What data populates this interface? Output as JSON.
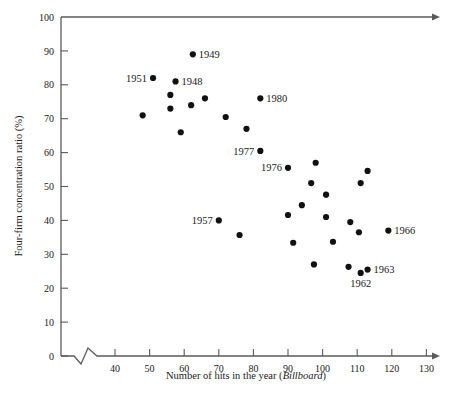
{
  "chart_data": {
    "type": "scatter",
    "title": "",
    "xlabel": "Number of hits in the year (Billboard)",
    "xlabel_plain": "Number of hits in the year (",
    "xlabel_italic": "Billboard",
    "xlabel_tail": ")",
    "ylabel": "Four-firm concentration ratio (%)",
    "xlim": [
      33,
      133
    ],
    "ylim": [
      0,
      100
    ],
    "xticks": [
      40,
      50,
      60,
      70,
      80,
      90,
      100,
      110,
      120,
      130
    ],
    "yticks": [
      0,
      10,
      20,
      30,
      40,
      50,
      60,
      70,
      80,
      90,
      100
    ],
    "xtick_labels": [
      "40",
      "50",
      "60",
      "70",
      "80",
      "90",
      "100",
      "110",
      "120",
      "130"
    ],
    "ytick_labels": [
      "0",
      "10",
      "20",
      "30",
      "40",
      "50",
      "60",
      "70",
      "80",
      "90",
      "100"
    ],
    "grid": false,
    "legend": "none",
    "axis_break_x": true,
    "axis_arrow_x": true,
    "axis_arrow_top": true,
    "marker": "filled-circle",
    "marker_color": "#111111",
    "points": [
      {
        "x": 48,
        "y": 71,
        "label": ""
      },
      {
        "x": 51,
        "y": 82,
        "label": "1951",
        "label_pos": "left"
      },
      {
        "x": 56,
        "y": 77,
        "label": ""
      },
      {
        "x": 56,
        "y": 73,
        "label": ""
      },
      {
        "x": 57.5,
        "y": 81,
        "label": "1948",
        "label_pos": "right"
      },
      {
        "x": 59,
        "y": 66,
        "label": ""
      },
      {
        "x": 62,
        "y": 74,
        "label": ""
      },
      {
        "x": 62.5,
        "y": 89,
        "label": "1949",
        "label_pos": "right"
      },
      {
        "x": 66,
        "y": 76,
        "label": ""
      },
      {
        "x": 70,
        "y": 40,
        "label": "1957",
        "label_pos": "left"
      },
      {
        "x": 72,
        "y": 70.5,
        "label": ""
      },
      {
        "x": 76,
        "y": 35.7,
        "label": ""
      },
      {
        "x": 78,
        "y": 67,
        "label": ""
      },
      {
        "x": 82,
        "y": 60.5,
        "label": "1977",
        "label_pos": "left"
      },
      {
        "x": 82,
        "y": 76,
        "label": "1980",
        "label_pos": "right"
      },
      {
        "x": 90,
        "y": 55.5,
        "label": "1976",
        "label_pos": "left"
      },
      {
        "x": 90,
        "y": 41.6,
        "label": ""
      },
      {
        "x": 91.5,
        "y": 33.4,
        "label": ""
      },
      {
        "x": 94,
        "y": 44.5,
        "label": ""
      },
      {
        "x": 96.7,
        "y": 51,
        "label": ""
      },
      {
        "x": 97.5,
        "y": 27,
        "label": ""
      },
      {
        "x": 98,
        "y": 57,
        "label": ""
      },
      {
        "x": 101,
        "y": 47.6,
        "label": ""
      },
      {
        "x": 101,
        "y": 41,
        "label": ""
      },
      {
        "x": 103,
        "y": 33.7,
        "label": ""
      },
      {
        "x": 107.5,
        "y": 26.3,
        "label": ""
      },
      {
        "x": 108,
        "y": 39.5,
        "label": ""
      },
      {
        "x": 110.5,
        "y": 36.5,
        "label": ""
      },
      {
        "x": 111,
        "y": 51,
        "label": ""
      },
      {
        "x": 111,
        "y": 24.5,
        "label": "1962",
        "label_pos": "below"
      },
      {
        "x": 113,
        "y": 54.6,
        "label": ""
      },
      {
        "x": 113,
        "y": 25.5,
        "label": "1963",
        "label_pos": "right"
      },
      {
        "x": 119,
        "y": 37,
        "label": "1966",
        "label_pos": "right"
      }
    ]
  }
}
